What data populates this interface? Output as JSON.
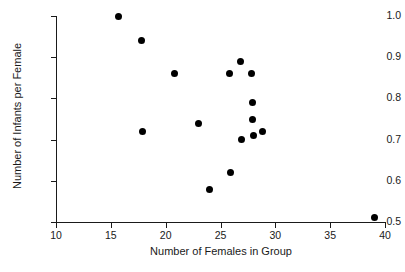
{
  "chart_data": {
    "type": "scatter",
    "title": "",
    "xlabel": "Number of Females in Group",
    "ylabel": "Number of Infants per Female",
    "xlim": [
      10,
      40
    ],
    "ylim": [
      0.5,
      1.0
    ],
    "xticks": [
      10,
      15,
      20,
      25,
      30,
      35,
      40
    ],
    "xtick_labels": [
      "10",
      "15",
      "20",
      "25",
      "30",
      "35",
      "40"
    ],
    "yticks": [
      0.5,
      0.6,
      0.7,
      0.8,
      0.9,
      1.0
    ],
    "ytick_labels": [
      "0.5",
      "0.6",
      "0.7",
      "0.8",
      "0.9",
      "1.0"
    ],
    "grid": false,
    "legend": false,
    "marker": "filled-circle",
    "marker_color": "#000000",
    "axis_color": "#1a1a1a",
    "background_color": "#ffffff",
    "x": [
      15.7,
      17.8,
      17.9,
      20.8,
      23.0,
      24.0,
      25.8,
      25.9,
      26.8,
      26.9,
      27.8,
      27.9,
      27.9,
      28.0,
      28.8,
      39.0
    ],
    "y": [
      1.0,
      0.94,
      0.72,
      0.86,
      0.74,
      0.58,
      0.86,
      0.62,
      0.89,
      0.7,
      0.86,
      0.79,
      0.75,
      0.71,
      0.72,
      0.51
    ],
    "points": [
      {
        "x": 15.7,
        "y": 1.0
      },
      {
        "x": 17.8,
        "y": 0.94
      },
      {
        "x": 17.9,
        "y": 0.72
      },
      {
        "x": 20.8,
        "y": 0.86
      },
      {
        "x": 23.0,
        "y": 0.74
      },
      {
        "x": 24.0,
        "y": 0.58
      },
      {
        "x": 25.8,
        "y": 0.86
      },
      {
        "x": 25.9,
        "y": 0.62
      },
      {
        "x": 26.8,
        "y": 0.89
      },
      {
        "x": 26.9,
        "y": 0.7
      },
      {
        "x": 27.8,
        "y": 0.86
      },
      {
        "x": 27.9,
        "y": 0.79
      },
      {
        "x": 27.9,
        "y": 0.75
      },
      {
        "x": 28.0,
        "y": 0.71
      },
      {
        "x": 28.8,
        "y": 0.72
      },
      {
        "x": 39.0,
        "y": 0.51
      }
    ]
  }
}
